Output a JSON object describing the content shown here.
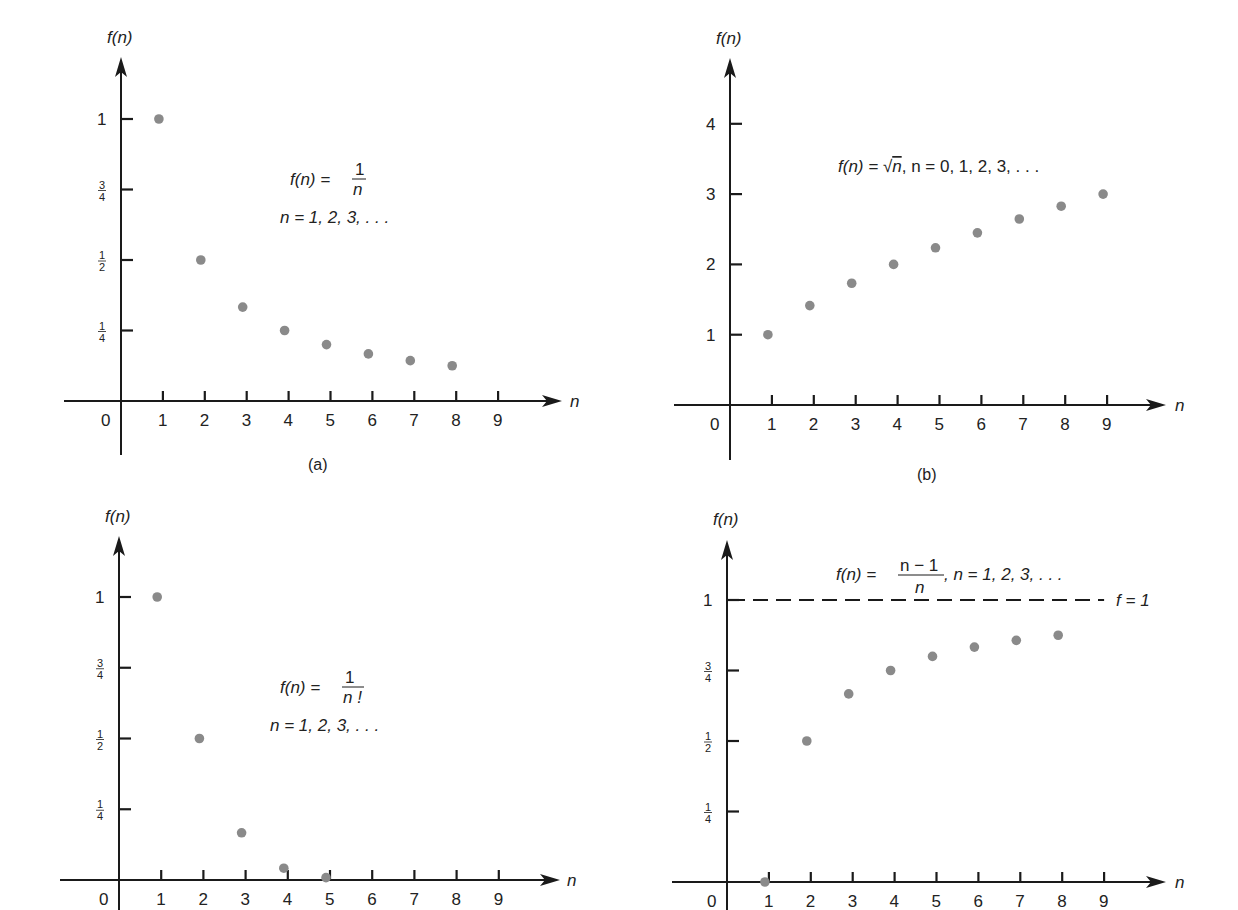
{
  "figure": {
    "colors": {
      "ink": "#1a1a1a",
      "dot": "#8a8a8a",
      "background": "#ffffff"
    }
  },
  "chart_data": [
    {
      "id": "a",
      "type": "scatter",
      "caption": "(a)",
      "title": "f(n) = 1/n",
      "formula": {
        "lhs": "f(n) =",
        "numerator": "1",
        "denominator": "n",
        "domain": "n = 1, 2, 3, . . ."
      },
      "xlabel": "n",
      "ylabel": "f(n)",
      "x_ticks": [
        "0",
        "1",
        "2",
        "3",
        "4",
        "5",
        "6",
        "7",
        "8",
        "9"
      ],
      "y_ticks": [
        {
          "value": 0.25,
          "num": "1",
          "den": "4"
        },
        {
          "value": 0.5,
          "num": "1",
          "den": "2"
        },
        {
          "value": 0.75,
          "num": "3",
          "den": "4"
        },
        {
          "value": 1,
          "label": "1"
        }
      ],
      "x": [
        1,
        2,
        3,
        4,
        5,
        6,
        7,
        8
      ],
      "values": [
        1.0,
        0.5,
        0.333,
        0.25,
        0.2,
        0.167,
        0.143,
        0.125
      ],
      "xlim": [
        0,
        9
      ],
      "ylim": [
        0,
        1.25
      ],
      "grid": false,
      "layout": {
        "ox": 121,
        "oy": 401,
        "dx": 41.9,
        "dy": 282,
        "xmin_px": 64,
        "xarrow": 562,
        "ybottom": 455,
        "ytop": 57,
        "fn_label_y": 43,
        "caption_y": 470,
        "formula_x": 290,
        "formula_y": 185,
        "n_label_x": 570
      }
    },
    {
      "id": "b",
      "type": "scatter",
      "caption": "(b)",
      "title": "f(n) = √n",
      "formula": {
        "lhs": "f(n) = ",
        "root": "√",
        "radicand": "n",
        "domain": ", n = 0, 1, 2, 3, . . ."
      },
      "xlabel": "n",
      "ylabel": "f(n)",
      "x_ticks": [
        "0",
        "1",
        "2",
        "3",
        "4",
        "5",
        "6",
        "7",
        "8",
        "9"
      ],
      "y_ticks": [
        {
          "value": 1,
          "label": "1"
        },
        {
          "value": 2,
          "label": "2"
        },
        {
          "value": 3,
          "label": "3"
        },
        {
          "value": 4,
          "label": "4"
        }
      ],
      "x": [
        1,
        2,
        3,
        4,
        5,
        6,
        7,
        8,
        9
      ],
      "values": [
        1.0,
        1.414,
        1.732,
        2.0,
        2.236,
        2.449,
        2.646,
        2.828,
        3.0
      ],
      "xlim": [
        0,
        9
      ],
      "ylim": [
        0,
        4.8
      ],
      "grid": false,
      "layout": {
        "ox": 730,
        "oy": 405,
        "dx": 41.9,
        "dy": 70.3,
        "xmin_px": 674,
        "xarrow": 1166,
        "ybottom": 460,
        "ytop": 58,
        "fn_label_y": 44,
        "caption_y": 480,
        "formula_x": 838,
        "formula_y": 172,
        "n_label_x": 1175
      }
    },
    {
      "id": "c",
      "type": "scatter",
      "caption": "",
      "title": "f(n) = 1/n!",
      "formula": {
        "lhs": "f(n) =",
        "numerator": "1",
        "denominator": "n !",
        "domain": "n = 1, 2, 3, . . ."
      },
      "xlabel": "n",
      "ylabel": "f(n)",
      "x_ticks": [
        "0",
        "1",
        "2",
        "3",
        "4",
        "5",
        "6",
        "7",
        "8",
        "9"
      ],
      "y_ticks": [
        {
          "value": 0.25,
          "num": "1",
          "den": "4"
        },
        {
          "value": 0.5,
          "num": "1",
          "den": "2"
        },
        {
          "value": 0.75,
          "num": "3",
          "den": "4"
        },
        {
          "value": 1,
          "label": "1"
        }
      ],
      "x": [
        1,
        2,
        3,
        4,
        5
      ],
      "values": [
        1.0,
        0.5,
        0.1667,
        0.0417,
        0.0083
      ],
      "xlim": [
        0,
        9
      ],
      "ylim": [
        0,
        1.25
      ],
      "grid": false,
      "layout": {
        "ox": 119,
        "oy": 880,
        "dx": 42.2,
        "dy": 283,
        "xmin_px": 60,
        "xarrow": 560,
        "ybottom": 910,
        "ytop": 536,
        "fn_label_y": 522,
        "caption_y": 0,
        "formula_x": 280,
        "formula_y": 693,
        "n_label_x": 567
      }
    },
    {
      "id": "d",
      "type": "scatter",
      "caption": "",
      "title": "f(n) = (n − 1)/n",
      "formula": {
        "lhs": "f(n) =",
        "numerator": "n − 1",
        "denominator": "n",
        "domain": ", n = 1, 2, 3, . . ."
      },
      "asymptote": {
        "y": 1,
        "label": "f  =  1",
        "style": "dashed"
      },
      "xlabel": "n",
      "ylabel": "f(n)",
      "x_ticks": [
        "0",
        "1",
        "2",
        "3",
        "4",
        "5",
        "6",
        "7",
        "8",
        "9"
      ],
      "y_ticks": [
        {
          "value": 0.25,
          "num": "1",
          "den": "4"
        },
        {
          "value": 0.5,
          "num": "1",
          "den": "2"
        },
        {
          "value": 0.75,
          "num": "3",
          "den": "4"
        },
        {
          "value": 1,
          "label": "1"
        }
      ],
      "x": [
        1,
        2,
        3,
        4,
        5,
        6,
        7,
        8
      ],
      "values": [
        0.0,
        0.5,
        0.667,
        0.75,
        0.8,
        0.833,
        0.857,
        0.875
      ],
      "xlim": [
        0,
        9
      ],
      "ylim": [
        0,
        1.25
      ],
      "grid": false,
      "layout": {
        "ox": 727,
        "oy": 882,
        "dx": 41.9,
        "dy": 282,
        "xmin_px": 672,
        "xarrow": 1166,
        "ybottom": 910,
        "ytop": 540,
        "fn_label_y": 525,
        "caption_y": 0,
        "formula_x": 836,
        "formula_y": 573,
        "n_label_x": 1175
      }
    }
  ]
}
